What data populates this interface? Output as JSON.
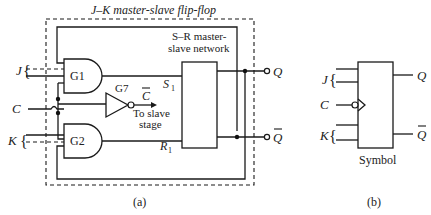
{
  "figure_a": {
    "title": "J–K master-slave flip-flop",
    "caption": "(a)",
    "inputs": {
      "j": "J",
      "c": "C",
      "k": "K"
    },
    "gates": {
      "g1": "G1",
      "g2": "G2",
      "g7": "G7"
    },
    "inverter_output": "C",
    "inverter_note_line1": "To slave",
    "inverter_note_line2": "stage",
    "network_label_line1": "S–R master-",
    "network_label_line2": "slave network",
    "s_pin": "S",
    "s_sub": "1",
    "r_pin": "R",
    "r_sub": "1",
    "outputs": {
      "q": "Q",
      "q_bar": "Q"
    }
  },
  "figure_b": {
    "caption": "(b)",
    "label": "Symbol",
    "inputs": {
      "j": "J",
      "c": "C",
      "k": "K"
    },
    "outputs": {
      "q": "Q",
      "q_bar": "Q"
    }
  }
}
